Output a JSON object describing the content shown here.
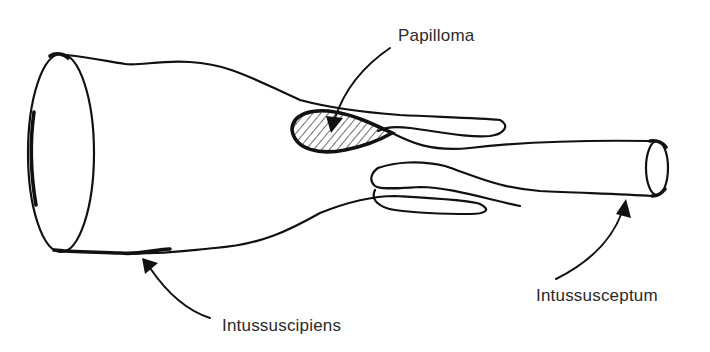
{
  "diagram": {
    "colors": {
      "line": "#111111",
      "text": "#2a2a2a",
      "background": "#ffffff"
    },
    "labels": {
      "papilloma": "Papilloma",
      "intussuscipiens": "Intussuscipiens",
      "intussusceptum": "Intussusceptum"
    }
  }
}
